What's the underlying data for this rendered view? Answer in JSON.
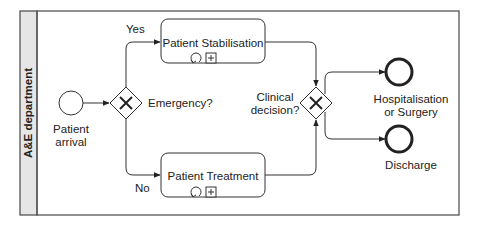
{
  "diagram": {
    "type": "BPMN process",
    "lane": {
      "title": "A&E department"
    },
    "start_event": {
      "label_line1": "Patient",
      "label_line2": "arrival"
    },
    "gateway_emergency": {
      "label": "Emergency?",
      "type": "exclusive"
    },
    "flow_yes": {
      "label": "Yes"
    },
    "flow_no": {
      "label": "No"
    },
    "task_stabilisation": {
      "label": "Patient Stabilisation",
      "markers": [
        "loop",
        "subprocess"
      ]
    },
    "task_treatment": {
      "label": "Patient Treatment",
      "markers": [
        "loop",
        "subprocess"
      ]
    },
    "gateway_clinical": {
      "label_line1": "Clinical",
      "label_line2": "decision?",
      "type": "exclusive"
    },
    "end_hospitalisation": {
      "label_line1": "Hospitalisation",
      "label_line2": "or Surgery"
    },
    "end_discharge": {
      "label": "Discharge"
    }
  },
  "colors": {
    "stroke": "#333333",
    "lane_header": "#e6e6e6",
    "background": "#ffffff"
  }
}
